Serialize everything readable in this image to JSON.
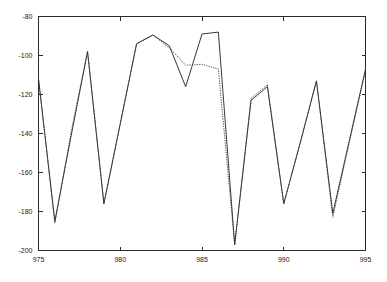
{
  "chart_data": {
    "type": "line",
    "title": "",
    "subtitle": "",
    "xlabel": "",
    "ylabel": "",
    "xlim": [
      975,
      995
    ],
    "ylim": [
      -200,
      -80
    ],
    "xticks": [
      975,
      980,
      985,
      990,
      995
    ],
    "yticks": [
      -80,
      -100,
      -120,
      -140,
      -160,
      -180,
      -200
    ],
    "xtick_labels": [
      "975",
      "980",
      "985",
      "990",
      "995"
    ],
    "ytick_labels": [
      "-80",
      "-100",
      "-120",
      "-140",
      "-160",
      "-180",
      "-200"
    ],
    "grid": false,
    "legend": "none",
    "annotations": [],
    "x": [
      975,
      976,
      977,
      978,
      979,
      980,
      981,
      982,
      983,
      984,
      985,
      986,
      987,
      988,
      989,
      990,
      991,
      992,
      993,
      994,
      995
    ],
    "series": [
      {
        "name": "solid",
        "style": "solid",
        "color": "#222222",
        "values": [
          -112,
          -185,
          -141,
          -98,
          -176,
          -135,
          -94,
          -89.5,
          -95,
          -116,
          -89,
          -88,
          -197,
          -123,
          -116,
          -176,
          -145,
          -113,
          -181,
          -144,
          -107
        ]
      },
      {
        "name": "dotted",
        "style": "dotted",
        "color": "#333333",
        "values": [
          -112,
          -186,
          -139,
          -98,
          -176,
          -135,
          -94,
          -89.5,
          -96,
          -105,
          -104.5,
          -107,
          -197,
          -122,
          -115,
          -176,
          -145,
          -113,
          -183,
          -145,
          -108
        ]
      }
    ]
  },
  "axes": {
    "y_axis_name": "y-axis",
    "x_axis_name": "x-axis"
  }
}
